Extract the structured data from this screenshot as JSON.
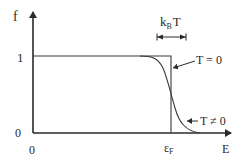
{
  "diagram": {
    "y_axis_label": "f",
    "x_axis_label": "E",
    "y_ticks": [
      "1",
      "0"
    ],
    "x_origin_label": "0",
    "fermi_label": "ε",
    "fermi_sub": "F",
    "width_label_k": "k",
    "width_label_sub": "B",
    "width_label_T": "T",
    "curve_labels": {
      "step": "T = 0",
      "smooth": "T ≠ 0"
    },
    "colors": {
      "ink": "#2a2a2a",
      "background": "#ffffff"
    }
  }
}
